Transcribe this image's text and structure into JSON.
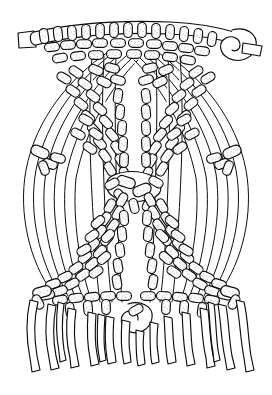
{
  "figure": {
    "kind": "line-art illustration",
    "caption": "",
    "width_px": 272,
    "height_px": 395,
    "background_color": "#ffffff",
    "ink_color": "#0d0d0d",
    "stipple_color": "#5d5d5d",
    "technique": "macrame",
    "stroke_style": "stippled outline cords"
  },
  "structure": {
    "mounting_cord": {
      "name": "horizontal mounting cord",
      "y_px": 40,
      "x_start_px": 18,
      "x_end_px": 252,
      "left_tail_label": "cut cord end",
      "right_tail_label": "overhand loop end"
    },
    "center_slit": {
      "name": "vertical open slit",
      "x_px": 130,
      "y_top_px": 78,
      "y_bottom_px": 320,
      "width_px": 14
    },
    "center_knot_cluster": {
      "name": "central crossing knot",
      "cx_px": 134,
      "cy_px": 186
    },
    "fringe": {
      "name": "bottom fringe",
      "cord_count": 16,
      "y_top_px": 300,
      "y_bottom_px": 372
    },
    "side_sweeps": {
      "left_cord_count": 6,
      "right_cord_count": 6,
      "description": "curved sweeping cords along outer edges"
    },
    "knot_rows": [
      {
        "id": "row-top",
        "label": "top horizontal knot bar",
        "y_px": 44,
        "direction": "horizontal"
      },
      {
        "id": "row-diag-upper-l",
        "label": "upper left diagonal knot row",
        "y_px": 120,
        "direction": "diagonal-down-right"
      },
      {
        "id": "row-diag-upper-r",
        "label": "upper right diagonal knot row",
        "y_px": 120,
        "direction": "diagonal-down-left"
      },
      {
        "id": "row-diag-mid-l",
        "label": "mid left diagonal knot row",
        "y_px": 186,
        "direction": "diagonal-up-right"
      },
      {
        "id": "row-diag-mid-r",
        "label": "mid right diagonal knot row",
        "y_px": 186,
        "direction": "diagonal-up-left"
      },
      {
        "id": "row-diag-lower-l",
        "label": "lower left diagonal knot row",
        "y_px": 270,
        "direction": "diagonal-down-right"
      },
      {
        "id": "row-diag-lower-r",
        "label": "lower right diagonal knot row",
        "y_px": 270,
        "direction": "diagonal-down-left"
      },
      {
        "id": "row-bottom",
        "label": "bottom knot cluster",
        "y_px": 300,
        "direction": "horizontal"
      }
    ]
  }
}
